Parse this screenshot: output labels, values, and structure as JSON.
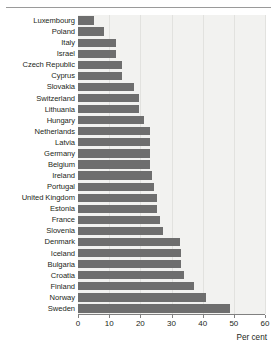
{
  "chart_data": {
    "type": "bar",
    "orientation": "horizontal",
    "title": "",
    "subtitle": "",
    "xlabel": "Per cent",
    "ylabel": "",
    "xlim": [
      0,
      60
    ],
    "xticks": [
      0,
      10,
      20,
      30,
      40,
      50,
      60
    ],
    "xticklabels": [
      "0",
      "10",
      "20",
      "30",
      "40",
      "50",
      "60"
    ],
    "grid": true,
    "grid_axis": "x",
    "legend": false,
    "legend_position": "none",
    "bar_color": "#6e6e6e",
    "plot_background": "#f2f2f0",
    "categories": [
      "Luxembourg",
      "Poland",
      "Italy",
      "Israel",
      "Czech Republic",
      "Cyprus",
      "Slovakia",
      "Switzerland",
      "Lithuania",
      "Hungary",
      "Netherlands",
      "Latvia",
      "Germany",
      "Belgium",
      "Ireland",
      "Portugal",
      "United Kingdom",
      "Estonia",
      "France",
      "Slovenia",
      "Denmark",
      "Iceland",
      "Bulgaria",
      "Croatia",
      "Finland",
      "Norway",
      "Sweden"
    ],
    "values": [
      5.1,
      8.3,
      12.3,
      12.3,
      14.1,
      14.1,
      18.0,
      19.7,
      19.7,
      21.1,
      23.0,
      23.0,
      23.0,
      23.1,
      23.6,
      24.5,
      25.2,
      25.2,
      26.4,
      27.2,
      32.6,
      33.2,
      33.2,
      34.0,
      37.2,
      41.0,
      48.7
    ]
  }
}
